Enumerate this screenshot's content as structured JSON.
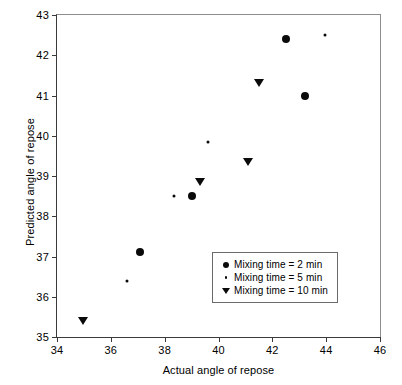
{
  "chart_data": {
    "type": "scatter",
    "title": "",
    "xlabel": "Actual angle of repose",
    "ylabel": "Predicted angle of repose",
    "xlim": [
      34,
      46
    ],
    "ylim": [
      35,
      43
    ],
    "xticks": [
      34,
      36,
      38,
      40,
      42,
      44,
      46
    ],
    "yticks": [
      35,
      36,
      37,
      38,
      39,
      40,
      41,
      42,
      43
    ],
    "grid": false,
    "legend_position": "lower right",
    "series": [
      {
        "name": "Mixing time = 2 min",
        "marker": "filled-circle",
        "color": "#0a0a0a",
        "points": [
          {
            "x": 37.1,
            "y": 37.1
          },
          {
            "x": 39.0,
            "y": 38.5
          },
          {
            "x": 42.5,
            "y": 42.4
          },
          {
            "x": 43.2,
            "y": 41.0
          }
        ]
      },
      {
        "name": "Mixing time = 5 min",
        "marker": "small-dot",
        "color": "#0a0a0a",
        "points": [
          {
            "x": 36.6,
            "y": 36.4
          },
          {
            "x": 38.35,
            "y": 38.5
          },
          {
            "x": 39.6,
            "y": 39.85
          },
          {
            "x": 43.95,
            "y": 42.5
          }
        ]
      },
      {
        "name": "Mixing time = 10 min",
        "marker": "filled-triangle-down",
        "color": "#0a0a0a",
        "points": [
          {
            "x": 34.95,
            "y": 35.4
          },
          {
            "x": 39.3,
            "y": 38.85
          },
          {
            "x": 41.1,
            "y": 39.35
          },
          {
            "x": 41.5,
            "y": 41.3
          }
        ]
      }
    ]
  },
  "legend": {
    "items": [
      {
        "label": "Mixing time = 2 min",
        "marker": "filled-circle"
      },
      {
        "label": "Mixing time = 5 min",
        "marker": "small-dot"
      },
      {
        "label": "Mixing time = 10 min",
        "marker": "filled-triangle-down"
      }
    ]
  },
  "colors": {
    "marker": "#0a0a0a",
    "axis": "#3a3a3a",
    "legend_border": "#6a6a6a",
    "background": "#ffffff"
  }
}
